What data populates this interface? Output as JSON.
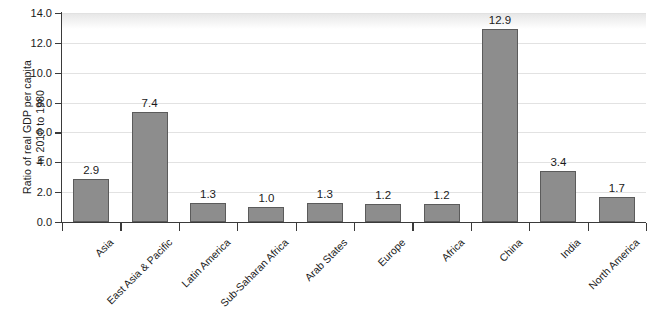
{
  "chart_data": {
    "type": "bar",
    "title": "",
    "subtitle": "",
    "xlabel": "",
    "ylabel_line1": "Ratio of real GDP per capita",
    "ylabel_line2": "in 2010 to 1980",
    "categories": [
      "Asia",
      "East Asia & Pacific",
      "Latin America",
      "Sub-Saharan Africa",
      "Arab States",
      "Europe",
      "Africa",
      "China",
      "India",
      "North America"
    ],
    "values": [
      2.9,
      7.4,
      1.3,
      1.0,
      1.3,
      1.2,
      1.2,
      12.9,
      3.4,
      1.7
    ],
    "value_labels": [
      "2.9",
      "7.4",
      "1.3",
      "1.0",
      "1.3",
      "1.2",
      "1.2",
      "12.9",
      "3.4",
      "1.7"
    ],
    "ylim": [
      0.0,
      14.0
    ],
    "ytick_values": [
      0.0,
      2.0,
      4.0,
      6.0,
      8.0,
      10.0,
      12.0,
      14.0
    ],
    "ytick_labels": [
      "0.0",
      "2.0",
      "4.0",
      "6.0",
      "8.0",
      "10.0",
      "12.0",
      "14.0"
    ],
    "grid": true,
    "grid_axis": "y",
    "legend": false,
    "legend_position": "none",
    "bar_color": "#8d8d8d",
    "bar_edge_color": "#5b5b5b",
    "grid_color": "#e2e2e2",
    "axis_color": "#3a3a3a",
    "text_color": "#1b1b1b",
    "background_color": "#ffffff",
    "label_rotation_degrees": -45
  }
}
